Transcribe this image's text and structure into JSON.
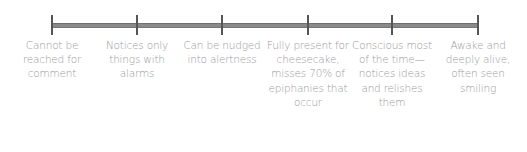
{
  "scale": {
    "line_color": "#8a8a8a",
    "text_color": "#9a9a9a",
    "points": [
      {
        "x": 52,
        "label": "Cannot be reached for comment"
      },
      {
        "x": 137,
        "label": "Notices only things with alarms"
      },
      {
        "x": 222,
        "label": "Can be nudged into alertness"
      },
      {
        "x": 308,
        "label": "Fully present for cheesecake, misses 70% of epiphanies that occur"
      },
      {
        "x": 392,
        "label": "Conscious most of the time—notices ideas and relishes them"
      },
      {
        "x": 478,
        "label": "Awake and deeply alive, often seen smiling"
      }
    ]
  }
}
